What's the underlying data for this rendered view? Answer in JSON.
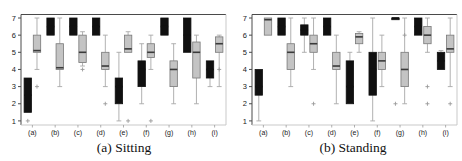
{
  "figure": {
    "left_caption": "(a) Sitting",
    "right_caption": "(b) Standing"
  },
  "chart_data": [
    {
      "type": "boxplot",
      "title": "(a) Sitting",
      "categories": [
        "(a)",
        "(b)",
        "(c)",
        "(d)",
        "(e)",
        "(f)",
        "(g)",
        "(h)",
        "(i)"
      ],
      "ylim": [
        1,
        7
      ],
      "yticks": [
        1,
        2,
        3,
        4,
        5,
        6,
        7
      ],
      "grid": false,
      "legend": "none",
      "colors": {
        "series1_fill": "#101010",
        "series1_stroke": "#101010",
        "series2_fill": "#c4c4c4",
        "series2_stroke": "#787878",
        "median": "#3a3a3a",
        "whisker": "#a8a8a8",
        "outlier": "#9a9a9a"
      },
      "series": [
        {
          "name": "black",
          "boxes": [
            {
              "low": 1.5,
              "q1": 1.5,
              "med": 2.5,
              "q3": 3.5,
              "high": 3.5,
              "out": [
                1
              ]
            },
            {
              "low": 6,
              "q1": 6,
              "med": 6.5,
              "q3": 7,
              "high": 7,
              "out": []
            },
            {
              "low": 6,
              "q1": 6,
              "med": 6.5,
              "q3": 7,
              "high": 7,
              "out": []
            },
            {
              "low": 6,
              "q1": 6,
              "med": 6.5,
              "q3": 7,
              "high": 7,
              "out": []
            },
            {
              "low": 1,
              "q1": 2,
              "med": 3,
              "q3": 3.5,
              "high": 5,
              "out": []
            },
            {
              "low": 2,
              "q1": 3,
              "med": 4,
              "q3": 4.5,
              "high": 5.5,
              "out": []
            },
            {
              "low": 6,
              "q1": 6,
              "med": 6.5,
              "q3": 7,
              "high": 7,
              "out": []
            },
            {
              "low": 5,
              "q1": 5,
              "med": 6,
              "q3": 7,
              "high": 7,
              "out": []
            },
            {
              "low": 3,
              "q1": 3.5,
              "med": 4,
              "q3": 4.5,
              "high": 4.5,
              "out": []
            }
          ]
        },
        {
          "name": "gray",
          "boxes": [
            {
              "low": 4,
              "q1": 5,
              "med": 5.1,
              "q3": 6,
              "high": 7,
              "out": [
                3
              ]
            },
            {
              "low": 3,
              "q1": 4,
              "med": 4.1,
              "q3": 5.5,
              "high": 7,
              "out": []
            },
            {
              "low": 4.2,
              "q1": 4.4,
              "med": 5,
              "q3": 6,
              "high": 6.2,
              "out": [
                4
              ]
            },
            {
              "low": 3,
              "q1": 4,
              "med": 4.2,
              "q3": 5,
              "high": 6,
              "out": [
                2
              ]
            },
            {
              "low": 5,
              "q1": 5,
              "med": 5.2,
              "q3": 6,
              "high": 6.2,
              "out": [
                1
              ]
            },
            {
              "low": 4,
              "q1": 4.7,
              "med": 5,
              "q3": 5.5,
              "high": 6,
              "out": [
                1
              ]
            },
            {
              "low": 2,
              "q1": 3,
              "med": 4,
              "q3": 4.5,
              "high": 5.5,
              "out": []
            },
            {
              "low": 2,
              "q1": 3.5,
              "med": 5,
              "q3": 5.6,
              "high": 6,
              "out": []
            },
            {
              "low": 3,
              "q1": 5,
              "med": 5.5,
              "q3": 5.9,
              "high": 6,
              "out": [
                4
              ]
            }
          ]
        }
      ]
    },
    {
      "type": "boxplot",
      "title": "(b) Standing",
      "categories": [
        "(a)",
        "(b)",
        "(c)",
        "(d)",
        "(e)",
        "(f)",
        "(g)",
        "(h)",
        "(i)"
      ],
      "ylim": [
        1,
        7
      ],
      "yticks": [
        1,
        2,
        3,
        4,
        5,
        6,
        7
      ],
      "grid": false,
      "legend": "none",
      "colors": {
        "series1_fill": "#101010",
        "series1_stroke": "#101010",
        "series2_fill": "#c4c4c4",
        "series2_stroke": "#787878",
        "median": "#3a3a3a",
        "whisker": "#a8a8a8",
        "outlier": "#9a9a9a"
      },
      "series": [
        {
          "name": "black",
          "boxes": [
            {
              "low": 1,
              "q1": 2.5,
              "med": 3,
              "q3": 4,
              "high": 4,
              "out": []
            },
            {
              "low": 6,
              "q1": 6,
              "med": 6.5,
              "q3": 7,
              "high": 7,
              "out": []
            },
            {
              "low": 5,
              "q1": 6,
              "med": 6.3,
              "q3": 6.6,
              "high": 7,
              "out": []
            },
            {
              "low": 6,
              "q1": 6,
              "med": 6.5,
              "q3": 7,
              "high": 7,
              "out": []
            },
            {
              "low": 2,
              "q1": 2,
              "med": 3,
              "q3": 4.5,
              "high": 5,
              "out": []
            },
            {
              "low": 1,
              "q1": 2.5,
              "med": 4,
              "q3": 5,
              "high": 7,
              "out": []
            },
            {
              "low": 6.9,
              "q1": 6.9,
              "med": 7,
              "q3": 7,
              "high": 7,
              "out": [
                2
              ]
            },
            {
              "low": 6,
              "q1": 6,
              "med": 6.5,
              "q3": 7,
              "high": 7,
              "out": []
            },
            {
              "low": 4,
              "q1": 4,
              "med": 4.5,
              "q3": 5,
              "high": 5.1,
              "out": []
            }
          ]
        },
        {
          "name": "gray",
          "boxes": [
            {
              "low": 6,
              "q1": 6,
              "med": 6.9,
              "q3": 7,
              "high": 7,
              "out": []
            },
            {
              "low": 3,
              "q1": 4,
              "med": 5,
              "q3": 5.5,
              "high": 7,
              "out": []
            },
            {
              "low": 4,
              "q1": 5,
              "med": 5.5,
              "q3": 6,
              "high": 7,
              "out": [
                2
              ]
            },
            {
              "low": 2,
              "q1": 4,
              "med": 4.2,
              "q3": 5,
              "high": 6,
              "out": []
            },
            {
              "low": 5,
              "q1": 5.5,
              "med": 5.9,
              "q3": 6.1,
              "high": 6.2,
              "out": []
            },
            {
              "low": 3,
              "q1": 4,
              "med": 4.5,
              "q3": 5,
              "high": 6,
              "out": []
            },
            {
              "low": 2,
              "q1": 3,
              "med": 4,
              "q3": 5,
              "high": 7,
              "out": [
                6
              ]
            },
            {
              "low": 5,
              "q1": 5.5,
              "med": 6,
              "q3": 6.5,
              "high": 7,
              "out": [
                3,
                2
              ]
            },
            {
              "low": 3,
              "q1": 5,
              "med": 5.2,
              "q3": 6,
              "high": 7,
              "out": [
                2
              ]
            }
          ]
        }
      ]
    }
  ]
}
